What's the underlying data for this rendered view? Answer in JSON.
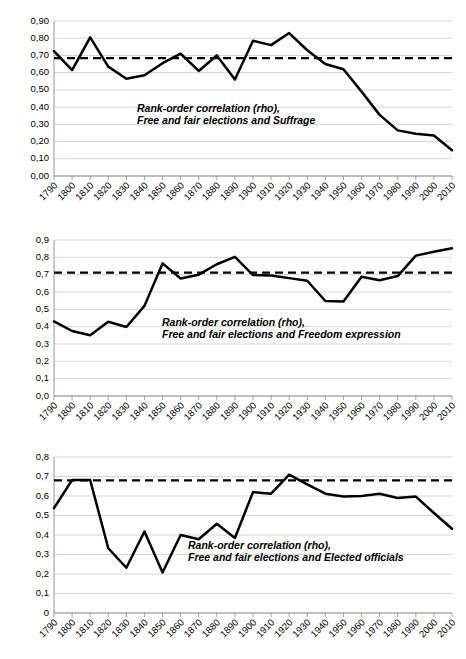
{
  "figure": {
    "background": "#ffffff",
    "line_color": "#000000",
    "grid_color": "#c9c9c9",
    "axis_color": "#8a8a8a"
  },
  "charts": [
    {
      "id": "chart-1",
      "chart_data": {
        "type": "line",
        "title": "",
        "xlabel": "",
        "ylabel": "",
        "grid": true,
        "legend": false,
        "annotation_line_1": "Rank-order correlation (rho),",
        "annotation_line_2": "Free and fair elections and Suffrage",
        "x": [
          1790,
          1800,
          1810,
          1820,
          1830,
          1840,
          1850,
          1860,
          1870,
          1880,
          1890,
          1900,
          1910,
          1920,
          1930,
          1940,
          1950,
          1960,
          1970,
          1980,
          1990,
          2000,
          2010
        ],
        "xtick_labels": [
          "1790",
          "1800",
          "1810",
          "1820",
          "1830",
          "1840",
          "1850",
          "1860",
          "1870",
          "1880",
          "1890",
          "1900",
          "1910",
          "1920",
          "1930",
          "1940",
          "1950",
          "1960",
          "1970",
          "1980",
          "1990",
          "2000",
          "2010"
        ],
        "values": [
          0.725,
          0.615,
          0.805,
          0.635,
          0.565,
          0.585,
          0.655,
          0.71,
          0.61,
          0.7,
          0.56,
          0.785,
          0.76,
          0.83,
          0.73,
          0.65,
          0.62,
          0.49,
          0.355,
          0.265,
          0.245,
          0.235,
          0.15
        ],
        "ytick_labels": [
          "0,00",
          "0,10",
          "0,20",
          "0,30",
          "0,40",
          "0,50",
          "0,60",
          "0,70",
          "0,80",
          "0,90"
        ],
        "ytick_values": [
          0.0,
          0.1,
          0.2,
          0.3,
          0.4,
          0.5,
          0.6,
          0.7,
          0.8,
          0.9
        ],
        "ylim": [
          0.0,
          0.9
        ],
        "mean_line_value": 0.685,
        "mean_line_label": "0,685"
      }
    },
    {
      "id": "chart-2",
      "chart_data": {
        "type": "line",
        "title": "",
        "xlabel": "",
        "ylabel": "",
        "grid": true,
        "legend": false,
        "annotation_line_1": "Rank-order correlation (rho),",
        "annotation_line_2": "Free and fair elections and Freedom expression",
        "x": [
          1790,
          1800,
          1810,
          1820,
          1830,
          1840,
          1850,
          1860,
          1870,
          1880,
          1890,
          1900,
          1910,
          1920,
          1930,
          1940,
          1950,
          1960,
          1970,
          1980,
          1990,
          2000,
          2010
        ],
        "xtick_labels": [
          "1790",
          "1800",
          "1810",
          "1820",
          "1830",
          "1840",
          "1850",
          "1860",
          "1870",
          "1880",
          "1890",
          "1900",
          "1910",
          "1920",
          "1930",
          "1940",
          "1950",
          "1960",
          "1970",
          "1980",
          "1990",
          "2000",
          "2010"
        ],
        "values": [
          0.43,
          0.375,
          0.35,
          0.428,
          0.398,
          0.52,
          0.765,
          0.678,
          0.7,
          0.76,
          0.803,
          0.698,
          0.695,
          0.68,
          0.665,
          0.548,
          0.545,
          0.688,
          0.668,
          0.692,
          0.81,
          0.832,
          0.852
        ],
        "ytick_labels": [
          "0,0",
          "0,1",
          "0,2",
          "0,3",
          "0,4",
          "0,5",
          "0,6",
          "0,7",
          "0,8",
          "0,9"
        ],
        "ytick_values": [
          0.0,
          0.1,
          0.2,
          0.3,
          0.4,
          0.5,
          0.6,
          0.7,
          0.8,
          0.9
        ],
        "ylim": [
          0.0,
          0.9
        ],
        "mean_line_value": 0.712,
        "mean_line_label": "0,712"
      }
    },
    {
      "id": "chart-3",
      "chart_data": {
        "type": "line",
        "title": "",
        "xlabel": "",
        "ylabel": "",
        "grid": true,
        "legend": false,
        "annotation_line_1": "Rank-order correlation (rho),",
        "annotation_line_2": "Free and fair elections and Elected officials",
        "x": [
          1790,
          1800,
          1810,
          1820,
          1830,
          1840,
          1850,
          1860,
          1870,
          1880,
          1890,
          1900,
          1910,
          1920,
          1930,
          1940,
          1950,
          1960,
          1970,
          1980,
          1990,
          2000,
          2010
        ],
        "xtick_labels": [
          "1790",
          "1800",
          "1810",
          "1820",
          "1830",
          "1840",
          "1850",
          "1860",
          "1870",
          "1880",
          "1890",
          "1900",
          "1910",
          "1920",
          "1930",
          "1940",
          "1950",
          "1960",
          "1970",
          "1980",
          "1990",
          "2000",
          "2010"
        ],
        "values": [
          0.538,
          0.682,
          0.682,
          0.332,
          0.232,
          0.418,
          0.208,
          0.4,
          0.378,
          0.458,
          0.385,
          0.62,
          0.612,
          0.71,
          0.66,
          0.612,
          0.597,
          0.6,
          0.612,
          0.59,
          0.597,
          0.513,
          0.432
        ],
        "ytick_labels": [
          "0",
          "0,1",
          "0,2",
          "0,3",
          "0,4",
          "0,5",
          "0,6",
          "0,7",
          "0,8"
        ],
        "ytick_values": [
          0.0,
          0.1,
          0.2,
          0.3,
          0.4,
          0.5,
          0.6,
          0.7,
          0.8
        ],
        "ylim": [
          0.0,
          0.8
        ],
        "mean_line_value": 0.68,
        "mean_line_label": "0,680"
      }
    }
  ]
}
